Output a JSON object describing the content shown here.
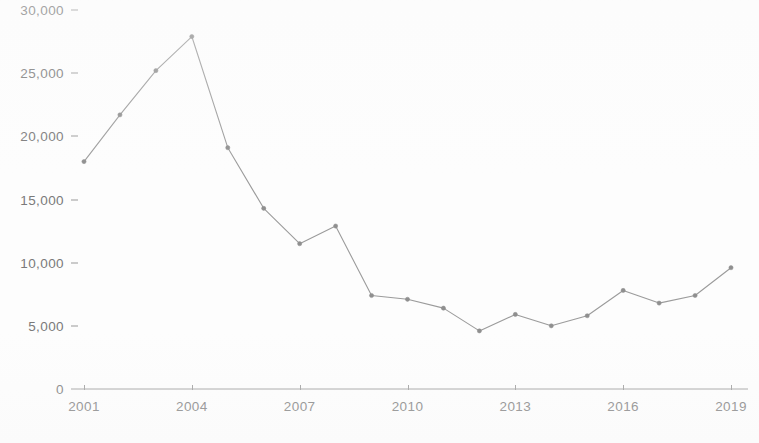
{
  "chart_data": {
    "type": "line",
    "title": "",
    "subtitle": "",
    "xlabel": "",
    "ylabel": "",
    "x": [
      2001,
      2002,
      2003,
      2004,
      2005,
      2006,
      2007,
      2008,
      2009,
      2010,
      2011,
      2012,
      2013,
      2014,
      2015,
      2016,
      2017,
      2018,
      2019
    ],
    "values": [
      18000,
      21700,
      25200,
      27900,
      19100,
      14300,
      11500,
      12900,
      7400,
      7100,
      6400,
      4600,
      5900,
      5000,
      5800,
      7800,
      6800,
      7400,
      9600
    ],
    "series": [
      {
        "name": "",
        "values": [
          18000,
          21700,
          25200,
          27900,
          19100,
          14300,
          11500,
          12900,
          7400,
          7100,
          6400,
          4600,
          5900,
          5000,
          5800,
          7800,
          6800,
          7400,
          9600
        ]
      }
    ],
    "xlim": [
      2001,
      2019
    ],
    "ylim": [
      0,
      30000
    ],
    "y_ticks": [
      0,
      5000,
      10000,
      15000,
      20000,
      25000,
      30000
    ],
    "y_tick_labels": [
      "0",
      "5,000",
      "10,000",
      "15,000",
      "20,000",
      "25,000",
      "30,000"
    ],
    "x_ticks": [
      2001,
      2004,
      2007,
      2010,
      2013,
      2016,
      2019
    ],
    "x_tick_labels": [
      "2001",
      "2004",
      "2007",
      "2010",
      "2013",
      "2016",
      "2019"
    ],
    "grid": false,
    "legend": "none",
    "line_color": "#9b9b9b",
    "marker_color": "#8f8f8f",
    "axis_color": "#9a9a9a",
    "background_color": "#fdfdfd",
    "text_color": "#7a7a7a"
  },
  "axes": {
    "y_axis_name": "y-axis",
    "x_axis_name": "x-axis"
  }
}
